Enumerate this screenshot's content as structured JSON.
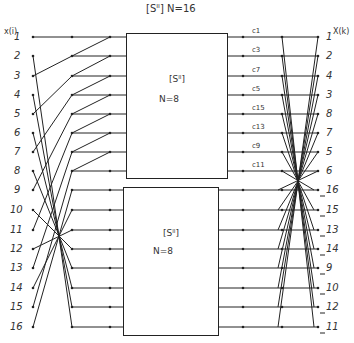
{
  "title": "[Sᴵᴵ]   N=16",
  "input_header": "x(i)",
  "output_header": "X(k)",
  "inputs": [
    "1",
    "2",
    "3",
    "4",
    "5",
    "6",
    "7",
    "8",
    "9",
    "10",
    "11",
    "12",
    "13",
    "14",
    "15",
    "16"
  ],
  "outputs": [
    "1",
    "2",
    "4",
    "3",
    "8",
    "7",
    "5",
    "6",
    "16",
    "15",
    "13",
    "14",
    "9",
    "10",
    "12",
    "11"
  ],
  "coefficients": [
    "c1",
    "c3",
    "c7",
    "c5",
    "c15",
    "c13",
    "c9",
    "c11"
  ],
  "blocks": [
    {
      "label": "[Sᴵᴵ]",
      "size": "N=8"
    },
    {
      "label": "[Sᴵᴵ]",
      "size": "N=8"
    }
  ],
  "stroke_color": "#222222"
}
